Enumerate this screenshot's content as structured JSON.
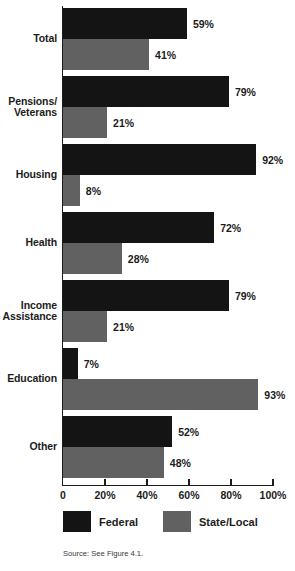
{
  "chart_data": {
    "type": "bar",
    "orientation": "horizontal",
    "title": "",
    "xlabel": "",
    "ylabel": "",
    "xlim": [
      0,
      100
    ],
    "grid": false,
    "legend_position": "bottom",
    "categories": [
      "Total",
      "Pensions/\nVeterans",
      "Housing",
      "Health",
      "Income\nAssistance",
      "Education",
      "Other"
    ],
    "series": [
      {
        "name": "Federal",
        "color": "#141414",
        "values": [
          59,
          79,
          92,
          72,
          79,
          7,
          52
        ],
        "labels": [
          "59%",
          "79%",
          "92%",
          "72%",
          "79%",
          "7%",
          "52%"
        ]
      },
      {
        "name": "State/Local",
        "color": "#616161",
        "values": [
          41,
          21,
          8,
          28,
          21,
          93,
          48
        ],
        "labels": [
          "41%",
          "21%",
          "8%",
          "28%",
          "21%",
          "93%",
          "48%"
        ]
      }
    ],
    "x_ticks": [
      0,
      20,
      40,
      60,
      80,
      100
    ],
    "x_tick_labels": [
      "0",
      "20%",
      "40%",
      "60%",
      "80%",
      "100%"
    ]
  },
  "legend": {
    "items": [
      {
        "label": "Federal",
        "color": "#141414"
      },
      {
        "label": "State/Local",
        "color": "#616161"
      }
    ]
  },
  "source": {
    "text": "Source: See Figure 4.1."
  }
}
